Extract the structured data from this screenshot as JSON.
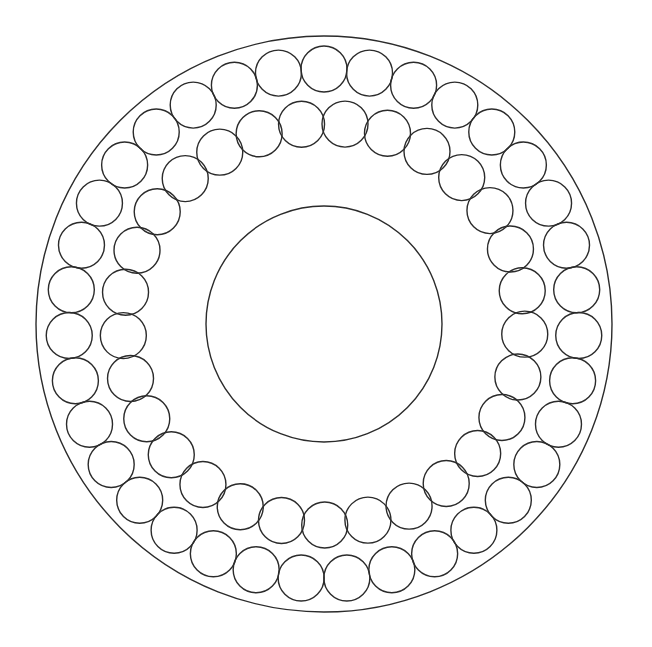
{
  "figure": {
    "width": 652,
    "height": 647,
    "background_color": "#ffffff",
    "stroke_color": "#2b2b2b",
    "stroke_width": 1.4
  },
  "chart_data": {
    "type": "scatter",
    "subtitle": "",
    "xlabel": "",
    "ylabel": "",
    "grid": false,
    "legend": "none",
    "xlim": [
      0,
      652
    ],
    "ylim": [
      0,
      647
    ],
    "center": {
      "x": 324,
      "y": 324
    },
    "boundaries": [
      {
        "name": "outer-boundary-circle",
        "cx": 324,
        "cy": 324,
        "r": 288,
        "fill": "none",
        "stroke": "#2b2b2b"
      },
      {
        "name": "inner-boundary-circle",
        "cx": 324,
        "cy": 324,
        "r": 118,
        "fill": "none",
        "stroke": "#2b2b2b"
      }
    ],
    "series": [
      {
        "name": "outer-ring",
        "count": 35,
        "ring_radius": 255,
        "circle_radius": 23,
        "start_angle_deg": -90,
        "fill": "none",
        "stroke": "#2b2b2b"
      },
      {
        "name": "inner-ring",
        "count": 29,
        "ring_radius": 201,
        "circle_radius": 23,
        "start_angle_deg": -84,
        "fill": "none",
        "stroke": "#2b2b2b"
      }
    ]
  }
}
